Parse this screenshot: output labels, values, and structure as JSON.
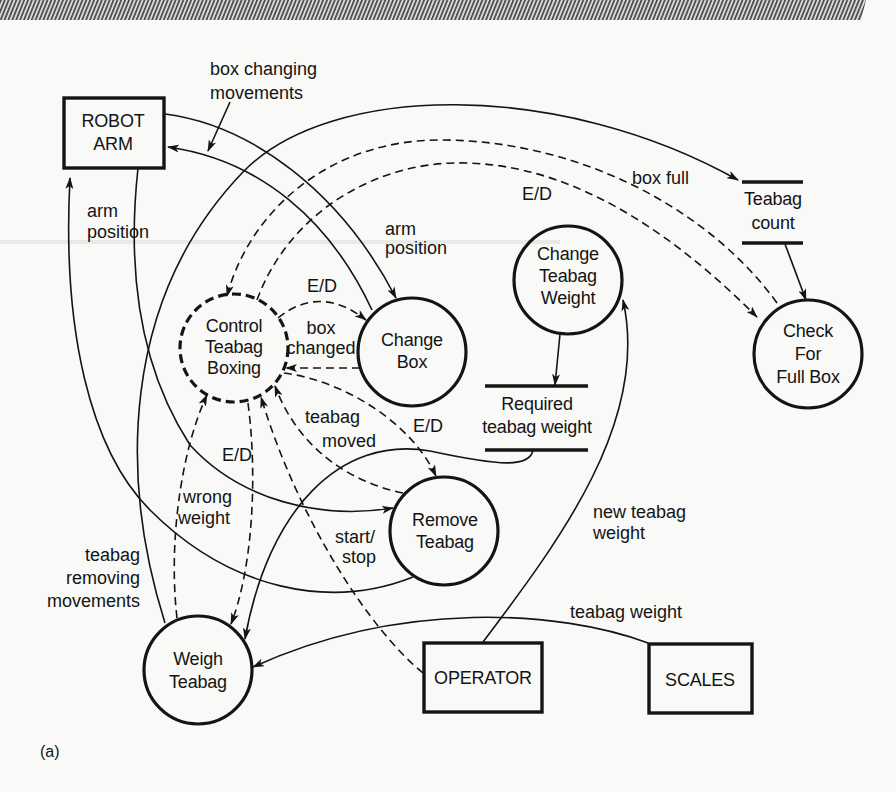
{
  "figure": {
    "caption": "(a)",
    "header_band": "hatched-bar"
  },
  "nodes": {
    "robot_arm": {
      "type": "terminator",
      "lines": [
        "ROBOT",
        "ARM"
      ]
    },
    "operator": {
      "type": "terminator",
      "lines": [
        "OPERATOR"
      ]
    },
    "scales": {
      "type": "terminator",
      "lines": [
        "SCALES"
      ]
    },
    "control_teabag_boxing": {
      "type": "control-process",
      "lines": [
        "Control",
        "Teabag",
        "Boxing"
      ]
    },
    "change_box": {
      "type": "process",
      "lines": [
        "Change",
        "Box"
      ]
    },
    "change_teabag_weight": {
      "type": "process",
      "lines": [
        "Change",
        "Teabag",
        "Weight"
      ]
    },
    "check_for_full_box": {
      "type": "process",
      "lines": [
        "Check",
        "For",
        "Full Box"
      ]
    },
    "remove_teabag": {
      "type": "process",
      "lines": [
        "Remove",
        "Teabag"
      ]
    },
    "weigh_teabag": {
      "type": "process",
      "lines": [
        "Weigh",
        "Teabag"
      ]
    },
    "teabag_count": {
      "type": "store",
      "lines": [
        "Teabag",
        "count"
      ]
    },
    "required_teabag_weight": {
      "type": "store",
      "lines": [
        "Required",
        "teabag weight"
      ]
    }
  },
  "flows": [
    {
      "from": "Change Box",
      "to": "ROBOT ARM",
      "style": "solid",
      "label": [
        "box changing",
        "movements"
      ]
    },
    {
      "from": "ROBOT ARM",
      "to": "Change Box",
      "style": "solid",
      "label": [
        "arm",
        "position"
      ]
    },
    {
      "from": "ROBOT ARM",
      "to": "Remove Teabag",
      "style": "solid",
      "label": [
        "arm",
        "position"
      ]
    },
    {
      "from": "Remove Teabag",
      "to": "ROBOT ARM",
      "style": "solid",
      "label": [
        "teabag",
        "removing",
        "movements"
      ]
    },
    {
      "from": "Check For Full Box",
      "to": "Control Teabag Boxing",
      "style": "dashed",
      "label": [
        "box full"
      ]
    },
    {
      "from": "Control Teabag Boxing",
      "to": "Check For Full Box",
      "style": "dashed",
      "label": [
        "E/D"
      ]
    },
    {
      "from": "Control Teabag Boxing",
      "to": "Change Box",
      "style": "dashed",
      "label": [
        "E/D"
      ]
    },
    {
      "from": "Change Box",
      "to": "Control Teabag Boxing",
      "style": "dashed",
      "label": [
        "box",
        "changed"
      ]
    },
    {
      "from": "Remove Teabag",
      "to": "Control Teabag Boxing",
      "style": "dashed",
      "label": [
        "teabag",
        "moved"
      ]
    },
    {
      "from": "Control Teabag Boxing",
      "to": "Remove Teabag",
      "style": "dashed",
      "label": [
        "E/D"
      ]
    },
    {
      "from": "Control Teabag Boxing",
      "to": "Weigh Teabag",
      "style": "dashed",
      "label": [
        "E/D"
      ]
    },
    {
      "from": "Weigh Teabag",
      "to": "Control Teabag Boxing",
      "style": "dashed",
      "label": [
        "wrong",
        "weight"
      ]
    },
    {
      "from": "OPERATOR",
      "to": "Control Teabag Boxing",
      "style": "dashed",
      "label": [
        "start/",
        "stop"
      ]
    },
    {
      "from": "OPERATOR",
      "to": "Change Teabag Weight",
      "style": "solid",
      "label": [
        "new teabag",
        "weight"
      ]
    },
    {
      "from": "SCALES",
      "to": "Weigh Teabag",
      "style": "solid",
      "label": [
        "teabag weight"
      ]
    },
    {
      "from": "Weigh Teabag",
      "to": "Teabag count",
      "style": "solid",
      "label": []
    },
    {
      "from": "Teabag count",
      "to": "Check For Full Box",
      "style": "solid",
      "label": []
    },
    {
      "from": "Change Teabag Weight",
      "to": "Required teabag weight",
      "style": "solid",
      "label": []
    },
    {
      "from": "Required teabag weight",
      "to": "Weigh Teabag",
      "style": "solid",
      "label": []
    }
  ]
}
